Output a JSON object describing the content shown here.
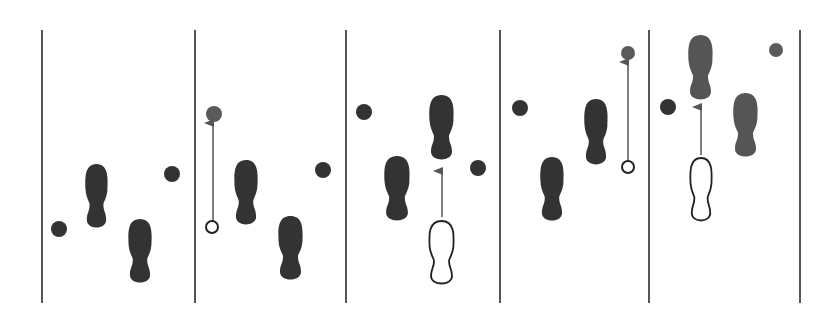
{
  "diagram": {
    "colors": {
      "background": "#ffffff",
      "line": "#555555",
      "foot": "#333333",
      "foot_light": "#555555",
      "dot": "#333333",
      "dot_gray": "#5a5a5a",
      "outline": "#222222"
    },
    "dividers": [
      42,
      195,
      346,
      500,
      649,
      800
    ],
    "panels": [
      {
        "id": 1,
        "feet": [
          {
            "x": 85,
            "y": 164,
            "w": 23,
            "h": 65,
            "style": "solid"
          },
          {
            "x": 128,
            "y": 219,
            "w": 24,
            "h": 65,
            "style": "solid"
          }
        ],
        "dots": [
          {
            "cx": 59,
            "cy": 229,
            "r": 8,
            "style": "solid"
          },
          {
            "cx": 172,
            "cy": 174,
            "r": 8,
            "style": "solid"
          }
        ],
        "arrows": []
      },
      {
        "id": 2,
        "feet": [
          {
            "x": 234,
            "y": 160,
            "w": 24,
            "h": 66,
            "style": "solid"
          },
          {
            "x": 278,
            "y": 216,
            "w": 25,
            "h": 65,
            "style": "solid"
          }
        ],
        "dots": [
          {
            "cx": 214,
            "cy": 114,
            "r": 8,
            "style": "gray"
          },
          {
            "cx": 212,
            "cy": 227,
            "r": 6,
            "style": "hollow"
          },
          {
            "cx": 323,
            "cy": 170,
            "r": 8,
            "style": "solid"
          }
        ],
        "arrows": [
          {
            "x": 213,
            "y1": 221,
            "y2": 123
          }
        ]
      },
      {
        "id": 3,
        "feet": [
          {
            "x": 384,
            "y": 156,
            "w": 26,
            "h": 66,
            "style": "solid"
          },
          {
            "x": 429,
            "y": 95,
            "w": 25,
            "h": 66,
            "style": "solid"
          },
          {
            "x": 429,
            "y": 221,
            "w": 25,
            "h": 64,
            "style": "outline"
          }
        ],
        "dots": [
          {
            "cx": 364,
            "cy": 112,
            "r": 8,
            "style": "solid"
          },
          {
            "cx": 478,
            "cy": 168,
            "r": 8,
            "style": "solid"
          }
        ],
        "arrows": [
          {
            "x": 442,
            "y1": 217,
            "y2": 171
          }
        ]
      },
      {
        "id": 4,
        "feet": [
          {
            "x": 540,
            "y": 157,
            "w": 24,
            "h": 65,
            "style": "solid"
          },
          {
            "x": 584,
            "y": 99,
            "w": 24,
            "h": 67,
            "style": "solid"
          }
        ],
        "dots": [
          {
            "cx": 520,
            "cy": 108,
            "r": 8,
            "style": "solid"
          },
          {
            "cx": 628,
            "cy": 53,
            "r": 7,
            "style": "gray"
          },
          {
            "cx": 628,
            "cy": 167,
            "r": 6,
            "style": "hollow"
          }
        ],
        "arrows": [
          {
            "x": 628,
            "y1": 161,
            "y2": 62
          }
        ]
      },
      {
        "id": 5,
        "feet": [
          {
            "x": 688,
            "y": 35,
            "w": 25,
            "h": 66,
            "style": "gray"
          },
          {
            "x": 733,
            "y": 93,
            "w": 25,
            "h": 65,
            "style": "gray"
          },
          {
            "x": 690,
            "y": 158,
            "w": 22,
            "h": 64,
            "style": "outline"
          }
        ],
        "dots": [
          {
            "cx": 668,
            "cy": 107,
            "r": 8,
            "style": "solid"
          },
          {
            "cx": 776,
            "cy": 50,
            "r": 7,
            "style": "gray"
          }
        ],
        "arrows": [
          {
            "x": 701,
            "y1": 155,
            "y2": 107
          }
        ]
      }
    ]
  }
}
